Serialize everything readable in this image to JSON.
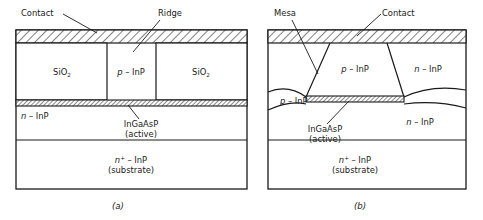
{
  "figure": {
    "panels": [
      {
        "id": "a",
        "caption": "(a)",
        "type": "ridge-waveguide-laser",
        "callouts": [
          {
            "name": "contact",
            "label": "Contact"
          },
          {
            "name": "ridge",
            "label": "Ridge"
          },
          {
            "name": "active",
            "label_line1": "InGaAsP",
            "label_line2": "(active)"
          }
        ],
        "regions": [
          {
            "name": "contact-layer",
            "label": "",
            "fill": "hatch-diagonal"
          },
          {
            "name": "oxide-left",
            "label": "SiO",
            "subscript": "2"
          },
          {
            "name": "ridge-p-inp",
            "label_italic": "p",
            "label_rest": " – InP"
          },
          {
            "name": "oxide-right",
            "label": "SiO",
            "subscript": "2"
          },
          {
            "name": "active-layer",
            "label": "",
            "fill": "hatch-dense"
          },
          {
            "name": "n-inp-cladding",
            "label_italic": "n",
            "label_rest": " – InP"
          },
          {
            "name": "substrate",
            "label_italic": "n",
            "superscript": "+",
            "label_rest": " – InP",
            "label_line2": "(substrate)"
          }
        ]
      },
      {
        "id": "b",
        "caption": "(b)",
        "type": "buried-heterostructure-laser",
        "callouts": [
          {
            "name": "mesa",
            "label": "Mesa"
          },
          {
            "name": "contact",
            "label": "Contact"
          },
          {
            "name": "active",
            "label_line1": "InGaAsP",
            "label_line2": "(active)"
          }
        ],
        "regions": [
          {
            "name": "contact-layer",
            "label": "",
            "fill": "hatch-diagonal"
          },
          {
            "name": "p-inp-center",
            "label_italic": "p",
            "label_rest": " – InP"
          },
          {
            "name": "n-inp-upper-right",
            "label_italic": "n",
            "label_rest": " – InP"
          },
          {
            "name": "p-inp-left",
            "label_italic": "p",
            "label_rest": " – InP"
          },
          {
            "name": "active-layer",
            "label": "",
            "fill": "hatch-dense"
          },
          {
            "name": "n-inp-lower",
            "label_italic": "n",
            "label_rest": " – InP"
          },
          {
            "name": "substrate",
            "label_italic": "n",
            "superscript": "+",
            "label_rest": " – InP",
            "label_line2": "(substrate)"
          }
        ]
      }
    ]
  },
  "text": {
    "contact": "Contact",
    "ridge": "Ridge",
    "mesa": "Mesa",
    "sio2_base": "SiO",
    "sio2_sub": "2",
    "p_italic": "p",
    "n_italic": "n",
    "n_plus_sup": "+",
    "inp_dash": " – InP",
    "ingaasp": "InGaAsP",
    "active": "(active)",
    "substrate": "(substrate)",
    "caption_a": "(a)",
    "caption_b": "(b)"
  },
  "colors": {
    "stroke": "#1a1a1a",
    "background": "#ffffff",
    "text": "#1a1a1a"
  }
}
